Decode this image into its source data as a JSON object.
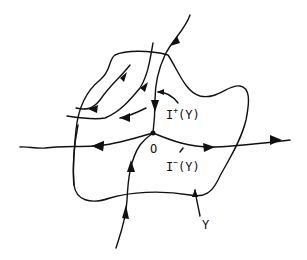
{
  "diagram": {
    "labels": {
      "i_plus_main": "I",
      "i_plus_sup": "+",
      "i_plus_arg": "(Y)",
      "i_minus_main": "I",
      "i_minus_sup": "−",
      "i_minus_arg": "(Y)",
      "origin": "O",
      "region": "Y"
    },
    "colors": {
      "ink": "#111111",
      "background": "#ffffff"
    }
  }
}
